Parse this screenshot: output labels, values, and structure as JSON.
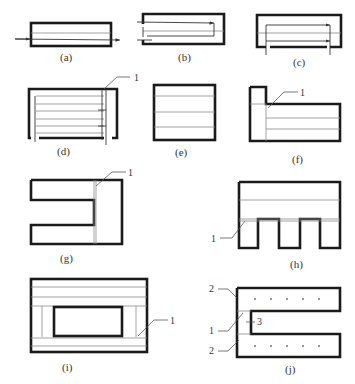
{
  "figure": {
    "panels": [
      {
        "id": "a",
        "caption": "(a)"
      },
      {
        "id": "b",
        "caption": "(b)"
      },
      {
        "id": "c",
        "caption": "(c)"
      },
      {
        "id": "d",
        "caption": "(d)",
        "callouts": [
          "1"
        ]
      },
      {
        "id": "e",
        "caption": "(e)"
      },
      {
        "id": "f",
        "caption": "(f)",
        "callouts": [
          "1"
        ]
      },
      {
        "id": "g",
        "caption": "(g)",
        "callouts": [
          "1"
        ]
      },
      {
        "id": "h",
        "caption": "(h)",
        "callouts": [
          "1"
        ]
      },
      {
        "id": "i",
        "caption": "(i)",
        "callouts": [
          "1"
        ]
      },
      {
        "id": "j",
        "caption": "(j)",
        "callouts": [
          "2",
          "1",
          "3",
          "2"
        ]
      }
    ]
  },
  "colors": {
    "frame": "#1a1a1a",
    "thin_line": "#8a8a8a",
    "text": "#333333"
  }
}
